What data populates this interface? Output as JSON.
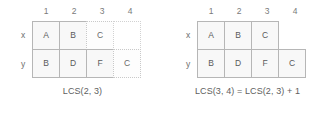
{
  "figure": {
    "colors": {
      "cell_fill": "#f8f8f8",
      "solid_border": "#b6b6b6",
      "dotted_border": "#c9c9c9",
      "text": "#5a5a5a",
      "background": "#ffffff"
    }
  },
  "panels": [
    {
      "id": "left",
      "column_headers": [
        "1",
        "2",
        "3",
        "4"
      ],
      "rows": [
        {
          "label": "x",
          "cells": [
            {
              "text": "A",
              "style": "solid"
            },
            {
              "text": "B",
              "style": "solid"
            },
            {
              "text": "C",
              "style": "dotted"
            },
            {
              "text": "",
              "style": "phantom"
            }
          ]
        },
        {
          "label": "y",
          "cells": [
            {
              "text": "B",
              "style": "solid"
            },
            {
              "text": "D",
              "style": "solid"
            },
            {
              "text": "F",
              "style": "solid"
            },
            {
              "text": "C",
              "style": "dotted"
            }
          ]
        }
      ],
      "caption": "LCS(2, 3)"
    },
    {
      "id": "right",
      "column_headers": [
        "1",
        "2",
        "3",
        "4"
      ],
      "rows": [
        {
          "label": "x",
          "cells": [
            {
              "text": "A",
              "style": "solid"
            },
            {
              "text": "B",
              "style": "solid"
            },
            {
              "text": "C",
              "style": "solid"
            },
            {
              "text": "",
              "style": "blank"
            }
          ]
        },
        {
          "label": "y",
          "cells": [
            {
              "text": "B",
              "style": "solid"
            },
            {
              "text": "D",
              "style": "solid"
            },
            {
              "text": "F",
              "style": "solid"
            },
            {
              "text": "C",
              "style": "solid"
            }
          ]
        }
      ],
      "caption": "LCS(3, 4) = LCS(2, 3) + 1"
    }
  ]
}
